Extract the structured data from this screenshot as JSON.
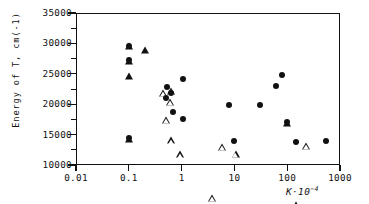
{
  "chart_data": {
    "type": "scatter",
    "title": "",
    "xlabel": "K·10⁻⁴",
    "ylabel": "Energy of T, cm(-1)",
    "xscale": "log",
    "yscale": "linear",
    "xlim": [
      0.01,
      1000
    ],
    "ylim": [
      10000,
      35000
    ],
    "grid": false,
    "legend": "none",
    "xticks": [
      "0.01",
      "0.1",
      "1",
      "10",
      "100",
      "1000"
    ],
    "xtick_values": [
      0.01,
      0.1,
      1,
      10,
      100,
      1000
    ],
    "yticks": [
      "10000",
      "15000",
      "20000",
      "25000",
      "30000",
      "35000"
    ],
    "ytick_values": [
      10000,
      15000,
      20000,
      25000,
      30000,
      35000
    ],
    "series": [
      {
        "name": "filled-circle",
        "marker": "filled-circle",
        "points": [
          {
            "x": 0.1,
            "y": 29600
          },
          {
            "x": 0.1,
            "y": 27300
          },
          {
            "x": 0.1,
            "y": 14450
          },
          {
            "x": 0.52,
            "y": 22800
          },
          {
            "x": 0.5,
            "y": 21000
          },
          {
            "x": 0.62,
            "y": 21800
          },
          {
            "x": 1.05,
            "y": 24100
          },
          {
            "x": 0.68,
            "y": 18700
          },
          {
            "x": 1.08,
            "y": 17600
          },
          {
            "x": 8.0,
            "y": 19950
          },
          {
            "x": 10.0,
            "y": 13900
          },
          {
            "x": 30.0,
            "y": 19900
          },
          {
            "x": 62.0,
            "y": 23000
          },
          {
            "x": 80.0,
            "y": 24750
          },
          {
            "x": 100.0,
            "y": 17000
          },
          {
            "x": 150.0,
            "y": 13800
          },
          {
            "x": 540.0,
            "y": 13900
          }
        ]
      },
      {
        "name": "filled-triangle",
        "marker": "filled-triangle",
        "points": [
          {
            "x": 0.1,
            "y": 29550
          },
          {
            "x": 0.1,
            "y": 27100
          },
          {
            "x": 0.1,
            "y": 24600
          },
          {
            "x": 0.2,
            "y": 28850
          },
          {
            "x": 0.1,
            "y": 14300
          },
          {
            "x": 100.0,
            "y": 16950
          }
        ]
      },
      {
        "name": "open-triangle",
        "marker": "open-triangle",
        "points": [
          {
            "x": 0.45,
            "y": 21900
          },
          {
            "x": 0.62,
            "y": 23350
          },
          {
            "x": 0.6,
            "y": 22650
          },
          {
            "x": 0.5,
            "y": 20900
          },
          {
            "x": 0.62,
            "y": 18650
          },
          {
            "x": 0.95,
            "y": 17500
          },
          {
            "x": 5.8,
            "y": 19950
          },
          {
            "x": 10.5,
            "y": 19950
          },
          {
            "x": 3.8,
            "y": 13850
          },
          {
            "x": 145.0,
            "y": 13800
          },
          {
            "x": 230.0,
            "y": 24650
          },
          {
            "x": 580.0,
            "y": 13850
          }
        ]
      }
    ]
  },
  "axes": {
    "y_axis_label": "Energy of T, cm(-1)",
    "x_axis_label_main": "K·10",
    "x_axis_label_exp": "−4"
  }
}
